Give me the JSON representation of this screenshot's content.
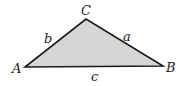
{
  "diagram": {
    "type": "triangle",
    "fill_color": "#d6d6d6",
    "stroke_color": "#1a1a1a",
    "vertices": [
      {
        "label": "A",
        "x": 25,
        "y": 67
      },
      {
        "label": "B",
        "x": 163,
        "y": 66
      },
      {
        "label": "C",
        "x": 86,
        "y": 19
      }
    ],
    "sides": [
      {
        "label": "a",
        "between": "B-C"
      },
      {
        "label": "b",
        "between": "A-C"
      },
      {
        "label": "c",
        "between": "A-B"
      }
    ]
  }
}
